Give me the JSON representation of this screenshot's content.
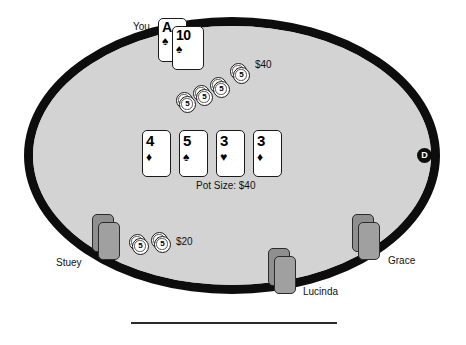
{
  "table": {
    "felt_color": "#d3d3d3",
    "rail_color": "#0d0d0d",
    "pot_label": "Pot Size: $40",
    "pot_amount": "$40"
  },
  "hero": {
    "name_label": "You",
    "cards": [
      {
        "rank": "A",
        "suit_name": "spade-icon",
        "suit": "♠"
      },
      {
        "rank": "10",
        "suit_name": "spade-icon",
        "suit": "♠"
      }
    ],
    "bet_label": "$40",
    "chip_denomination": "5",
    "chip_stack_count": 4
  },
  "board": {
    "cards": [
      {
        "rank": "4",
        "suit_name": "diamond-icon",
        "suit": "♦"
      },
      {
        "rank": "5",
        "suit_name": "spade-icon",
        "suit": "♠"
      },
      {
        "rank": "3",
        "suit_name": "heart-icon",
        "suit": "♥"
      },
      {
        "rank": "3",
        "suit_name": "diamond-icon",
        "suit": "♦"
      }
    ]
  },
  "opponents": [
    {
      "name_label": "Stuey",
      "bet_label": "$20",
      "chip_denomination": "5",
      "chip_stack_count": 2,
      "cards_face_down": 2
    },
    {
      "name_label": "Lucinda",
      "bet_label": "",
      "chip_stack_count": 0,
      "cards_face_down": 2
    },
    {
      "name_label": "Grace",
      "bet_label": "",
      "chip_stack_count": 0,
      "cards_face_down": 2
    }
  ],
  "dealer_button": {
    "label": "D"
  }
}
